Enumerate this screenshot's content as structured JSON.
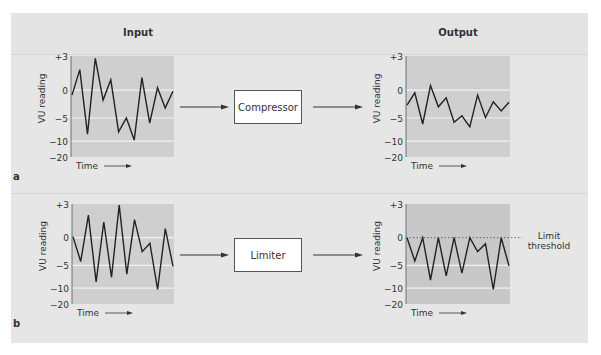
{
  "columns": {
    "input": "Input",
    "output": "Output"
  },
  "sections": {
    "a": {
      "label": "a",
      "processor": "Compressor"
    },
    "b": {
      "label": "b",
      "processor": "Limiter"
    }
  },
  "axis": {
    "ylabel": "VU reading",
    "xlabel": "Time",
    "ticks": [
      "+3",
      "0",
      "−5",
      "−10",
      "−20"
    ]
  },
  "annotation": {
    "line1": "Limit",
    "line2": "threshold"
  },
  "colors": {
    "panel": "#e6e6e6",
    "plot_top": "#cfcfcf",
    "plot_bottom_output": "#c8c8c8",
    "line": "#222222",
    "gridline": "#f2f2f2",
    "box": "#ffffff"
  },
  "chart_data": [
    {
      "type": "line",
      "title": "Input (a)",
      "xlabel": "Time",
      "ylabel": "VU reading",
      "yticks": [
        "+3",
        "0",
        "-5",
        "-10",
        "-20"
      ],
      "values": [
        -0.9,
        1.8,
        -8.5,
        2.8,
        -1.8,
        0.9,
        -8.0,
        -5.0,
        -9.8,
        1.1,
        -6.1,
        0.2,
        -3.2,
        -0.2
      ]
    },
    {
      "type": "line",
      "title": "Output (a) after Compressor",
      "xlabel": "Time",
      "ylabel": "VU reading",
      "yticks": [
        "+3",
        "0",
        "-5",
        "-10",
        "-20"
      ],
      "values": [
        -2.7,
        -0.5,
        -6.3,
        0.4,
        -3.0,
        -1.4,
        -5.9,
        -4.6,
        -6.9,
        -0.9,
        -4.9,
        -2.1,
        -3.75,
        -2.2
      ]
    },
    {
      "type": "line",
      "title": "Input (b)",
      "xlabel": "Time",
      "ylabel": "VU reading",
      "yticks": [
        "+3",
        "0",
        "-5",
        "-10",
        "-20"
      ],
      "values": [
        0.1,
        -4.3,
        2.0,
        -8.6,
        1.4,
        -7.6,
        2.9,
        -6.9,
        1.6,
        -2.5,
        -1.0,
        -10.8,
        0.8,
        -5.2
      ]
    },
    {
      "type": "line",
      "title": "Output (b) after Limiter",
      "xlabel": "Time",
      "ylabel": "VU reading",
      "yticks": [
        "+3",
        "0",
        "-5",
        "-10",
        "-20"
      ],
      "values": [
        0,
        -4.2,
        0,
        -8.2,
        0,
        -7.3,
        0,
        -6.7,
        0,
        -2.5,
        -1.1,
        -10.8,
        0,
        -5.1
      ],
      "threshold": 0,
      "threshold_label": "Limit threshold"
    }
  ]
}
